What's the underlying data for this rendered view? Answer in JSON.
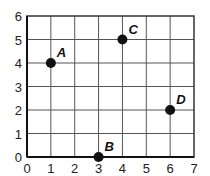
{
  "chart_data": {
    "type": "scatter",
    "title": "",
    "xlabel": "",
    "ylabel": "",
    "xlim": [
      0,
      7
    ],
    "ylim": [
      0,
      6
    ],
    "grid": true,
    "x_ticks": [
      "0",
      "1",
      "2",
      "3",
      "4",
      "5",
      "6",
      "7"
    ],
    "y_ticks": [
      "0",
      "1",
      "2",
      "3",
      "4",
      "5",
      "6"
    ],
    "points": [
      {
        "label": "A",
        "x": 1,
        "y": 4
      },
      {
        "label": "B",
        "x": 3,
        "y": 0
      },
      {
        "label": "C",
        "x": 4,
        "y": 5
      },
      {
        "label": "D",
        "x": 6,
        "y": 2
      }
    ]
  },
  "colors": {
    "grid": "#555555",
    "axis": "#333333",
    "point": "#111111"
  }
}
